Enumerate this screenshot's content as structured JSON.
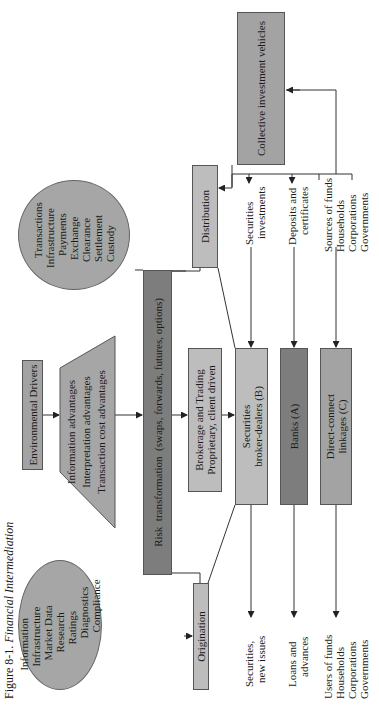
{
  "caption": {
    "figure_number": "Figure 8-1.",
    "title": "Financial Intermediation"
  },
  "information_circle": {
    "lines": [
      "Information",
      "Infrastructure",
      "Market Data",
      "Research",
      "Ratings",
      "Diagnostics",
      "Compliance"
    ]
  },
  "transactions_circle": {
    "lines": [
      "Transactions",
      "Infrastructure",
      "Payments",
      "Exchange",
      "Clearance",
      "Settlement",
      "Custody"
    ]
  },
  "environmental_drivers": {
    "label": "Environmental Drivers"
  },
  "advantages_trapezoid": {
    "lines": [
      "Information advantages",
      "Interpretation advantages",
      "Transaction cost advantages"
    ]
  },
  "risk_transformation": {
    "label": "Risk  transformation  (swaps, forwards, futures, options)"
  },
  "origination": {
    "label": "Origination"
  },
  "brokerage_trading": {
    "lines": [
      "Brokerage and Trading",
      "Proprietary, client driven"
    ]
  },
  "distribution": {
    "label": "Distribution"
  },
  "securities_broker_dealers": {
    "lines": [
      "Securities",
      "broker-dealers (B)"
    ]
  },
  "banks": {
    "label": "Banks (A)"
  },
  "direct_connect": {
    "lines": [
      "Direct-connect",
      "linkages (C)"
    ]
  },
  "collective_investment": {
    "label": "Collective investment vehicles"
  },
  "users_side": {
    "securities_new_issues": [
      "Securities,",
      "new issues"
    ],
    "loans_advances": [
      "Loans and",
      "advances"
    ],
    "users_of_funds": [
      "Users of funds",
      "Households",
      "Corporations",
      "Governments"
    ]
  },
  "sources_side": {
    "securities_investments": [
      "Securities",
      "investments"
    ],
    "deposits_certificates": [
      "Deposits and",
      "certificates"
    ],
    "sources_of_funds": [
      "Sources of funds",
      "Households",
      "Corporations",
      "Governments"
    ]
  },
  "colors": {
    "light_box": "#bdbdbd",
    "mid_box": "#a3a3a3",
    "dark_box": "#7d7d7d",
    "circle_fill": "#a6a6a6",
    "line": "#333333"
  }
}
